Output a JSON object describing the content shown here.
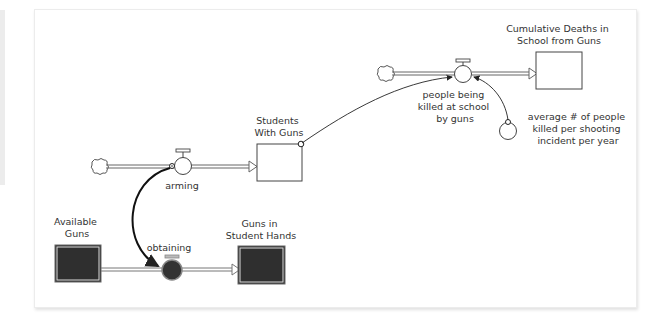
{
  "diagram": {
    "type": "stock-and-flow",
    "stocks": [
      {
        "id": "students_with_guns",
        "label": [
          "Students",
          "With Guns"
        ],
        "style": "white"
      },
      {
        "id": "cumulative_deaths",
        "label": [
          "Cumulative Deaths in",
          "School from Guns"
        ],
        "style": "white"
      },
      {
        "id": "available_guns",
        "label": [
          "Available",
          "Guns"
        ],
        "style": "dark"
      },
      {
        "id": "guns_in_student_hands",
        "label": [
          "Guns in",
          "Student Hands"
        ],
        "style": "dark"
      }
    ],
    "flows": [
      {
        "id": "arming",
        "label": [
          "arming"
        ],
        "from": "cloud",
        "to": "students_with_guns"
      },
      {
        "id": "people_killed",
        "label": [
          "people being",
          "killed at school",
          "by guns"
        ],
        "from": "cloud",
        "to": "cumulative_deaths"
      },
      {
        "id": "obtaining",
        "label": [
          "obtaining"
        ],
        "from": "available_guns",
        "to": "guns_in_student_hands",
        "style": "dark"
      }
    ],
    "converters": [
      {
        "id": "avg_people_killed",
        "label": [
          "average # of people",
          "killed per shooting",
          "incident per year"
        ]
      }
    ],
    "connectors": [
      {
        "from": "students_with_guns",
        "to": "people_killed"
      },
      {
        "from": "avg_people_killed",
        "to": "people_killed"
      },
      {
        "from": "arming",
        "to": "obtaining"
      }
    ],
    "colors": {
      "line": "#333333",
      "dark_fill": "#2f2f2f",
      "pipe": "#555555",
      "background": "#ffffff"
    }
  }
}
